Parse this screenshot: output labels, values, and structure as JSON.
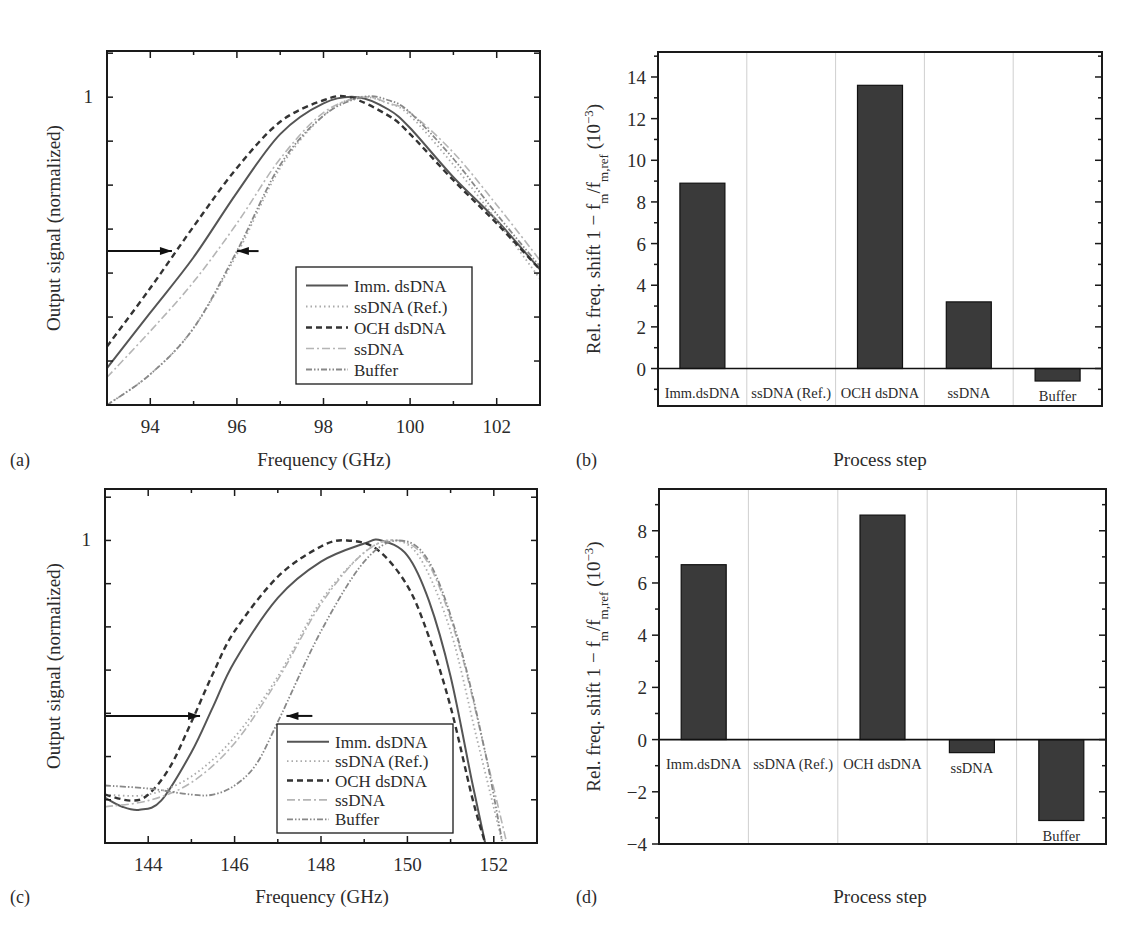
{
  "figure": {
    "panels": [
      "(a)",
      "(b)",
      "(c)",
      "(d)"
    ]
  },
  "chart_data": [
    {
      "id": "a",
      "panel_label": "(a)",
      "type": "line",
      "title": "",
      "xlabel": "Frequency (GHz)",
      "ylabel": "Output signal (normalized)",
      "xlim": [
        93,
        103
      ],
      "ylim": [
        0.0,
        1.15
      ],
      "xticks": [
        94,
        96,
        98,
        100,
        102
      ],
      "yticks_labeled": [
        {
          "value": 1,
          "label": "1"
        }
      ],
      "grid": false,
      "legend_position": "lower right",
      "annotations": [
        {
          "type": "arrow-right",
          "y": 0.5,
          "x_from": 93,
          "x_to": 94.5
        },
        {
          "type": "arrow-left",
          "y": 0.5,
          "x_from": 96.5,
          "x_to": 96.0
        }
      ],
      "series": [
        {
          "name": "Imm. dsDNA",
          "style": "solid",
          "color": "#555555",
          "x": [
            93,
            94,
            95,
            96,
            97,
            98,
            98.8,
            99.5,
            100,
            101,
            102,
            103
          ],
          "y": [
            0.12,
            0.3,
            0.48,
            0.69,
            0.88,
            0.98,
            1.0,
            0.96,
            0.9,
            0.74,
            0.6,
            0.44
          ]
        },
        {
          "name": "ssDNA (Ref.)",
          "style": "dotted",
          "color": "#aaaaaa",
          "x": [
            93,
            94,
            95,
            96,
            97,
            98,
            98.8,
            99.5,
            100,
            101,
            102,
            103
          ],
          "y": [
            0.0,
            0.1,
            0.25,
            0.49,
            0.77,
            0.94,
            1.0,
            0.98,
            0.94,
            0.78,
            0.6,
            0.41
          ]
        },
        {
          "name": "OCH dsDNA",
          "style": "dashed",
          "color": "#333333",
          "x": [
            93,
            94,
            95,
            96,
            97,
            98,
            98.6,
            99.5,
            100,
            101,
            102,
            103
          ],
          "y": [
            0.19,
            0.38,
            0.58,
            0.77,
            0.92,
            0.99,
            1.0,
            0.94,
            0.88,
            0.73,
            0.59,
            0.44
          ]
        },
        {
          "name": "ssDNA",
          "style": "dashdot",
          "color": "#b5b5b5",
          "x": [
            93,
            94,
            95,
            96,
            97,
            98,
            98.9,
            99.5,
            100,
            101,
            102,
            103
          ],
          "y": [
            0.09,
            0.24,
            0.4,
            0.59,
            0.8,
            0.95,
            1.0,
            0.98,
            0.95,
            0.82,
            0.65,
            0.47
          ]
        },
        {
          "name": "Buffer",
          "style": "dashdotdot",
          "color": "#888888",
          "x": [
            93,
            94,
            95,
            96,
            97,
            98,
            98.9,
            99.5,
            100,
            101,
            102,
            103
          ],
          "y": [
            0.0,
            0.1,
            0.25,
            0.5,
            0.78,
            0.94,
            1.0,
            0.99,
            0.95,
            0.8,
            0.62,
            0.45
          ]
        }
      ]
    },
    {
      "id": "b",
      "panel_label": "(b)",
      "type": "bar",
      "title": "",
      "xlabel": "Process step",
      "ylabel": "Rel. freq. shift 1 − f_m/f_m,ref (10^−3)",
      "ylabel_parts": {
        "main": "Rel. freq. shift 1 − f",
        "sub1": "m",
        "mid": "/f",
        "sub2": "m,ref",
        "tail": " (10",
        "sup": "−3",
        "end": ")"
      },
      "ylim": [
        -1.8,
        15.2
      ],
      "yticks": [
        0,
        2,
        4,
        6,
        8,
        10,
        12,
        14
      ],
      "grid": false,
      "categories": [
        "Imm.dsDNA",
        "ssDNA (Ref.)",
        "OCH dsDNA",
        "ssDNA",
        "Buffer"
      ],
      "values": [
        8.9,
        0.0,
        13.6,
        3.2,
        -0.6
      ],
      "bar_color": "#3a3a3a"
    },
    {
      "id": "c",
      "panel_label": "(c)",
      "type": "line",
      "title": "",
      "xlabel": "Frequency (GHz)",
      "ylabel": "Output signal (normalized)",
      "xlim": [
        143,
        153
      ],
      "ylim": [
        0.0,
        1.17
      ],
      "xticks": [
        144,
        146,
        148,
        150,
        152
      ],
      "yticks_labeled": [
        {
          "value": 1,
          "label": "1"
        }
      ],
      "grid": false,
      "legend_position": "lower right",
      "annotations": [
        {
          "type": "arrow-right",
          "y": 0.42,
          "x_from": 143,
          "x_to": 145.2
        },
        {
          "type": "arrow-left",
          "y": 0.42,
          "x_from": 147.8,
          "x_to": 147.2
        }
      ],
      "series": [
        {
          "name": "Imm. dsDNA",
          "style": "solid",
          "color": "#555555",
          "x": [
            143,
            143.4,
            143.8,
            144.3,
            145,
            145.5,
            146,
            147,
            148,
            149,
            149.4,
            150,
            150.5,
            151,
            151.5,
            151.8
          ],
          "y": [
            0.15,
            0.12,
            0.11,
            0.14,
            0.3,
            0.45,
            0.6,
            0.81,
            0.93,
            0.99,
            1.0,
            0.95,
            0.8,
            0.55,
            0.2,
            0.0
          ]
        },
        {
          "name": "ssDNA (Ref.)",
          "style": "dotted",
          "color": "#aaaaaa",
          "x": [
            143,
            144,
            145,
            146,
            147,
            148,
            149,
            149.7,
            150.3,
            151,
            151.6,
            152.2
          ],
          "y": [
            0.16,
            0.16,
            0.22,
            0.35,
            0.55,
            0.8,
            0.96,
            1.0,
            0.94,
            0.7,
            0.35,
            0.0
          ]
        },
        {
          "name": "OCH dsDNA",
          "style": "dashed",
          "color": "#333333",
          "x": [
            143,
            143.6,
            144,
            144.5,
            145,
            145.5,
            146,
            147,
            148,
            148.6,
            149.3,
            150,
            150.5,
            151,
            151.5,
            151.8
          ],
          "y": [
            0.16,
            0.14,
            0.16,
            0.25,
            0.4,
            0.56,
            0.7,
            0.88,
            0.98,
            1.0,
            0.97,
            0.85,
            0.68,
            0.45,
            0.15,
            0.0
          ]
        },
        {
          "name": "ssDNA",
          "style": "dashdot",
          "color": "#b5b5b5",
          "x": [
            143,
            144,
            145,
            146,
            147,
            148,
            149,
            149.8,
            150.5,
            151.2,
            151.8,
            152.3
          ],
          "y": [
            0.12,
            0.14,
            0.2,
            0.33,
            0.54,
            0.79,
            0.96,
            1.0,
            0.92,
            0.65,
            0.3,
            0.0
          ]
        },
        {
          "name": "Buffer",
          "style": "dashdotdot",
          "color": "#888888",
          "x": [
            143,
            144,
            145,
            145.5,
            146,
            146.5,
            147,
            148,
            149,
            149.8,
            150.5,
            151.2,
            151.8,
            152.2
          ],
          "y": [
            0.19,
            0.18,
            0.16,
            0.16,
            0.19,
            0.26,
            0.4,
            0.7,
            0.93,
            1.0,
            0.93,
            0.66,
            0.3,
            0.0
          ]
        }
      ]
    },
    {
      "id": "d",
      "panel_label": "(d)",
      "type": "bar",
      "title": "",
      "xlabel": "Process step",
      "ylabel": "Rel. freq. shift 1 − f_m/f_m,ref (10^−3)",
      "ylabel_parts": {
        "main": "Rel. freq. shift 1 − f",
        "sub1": "m",
        "mid": "/f",
        "sub2": "m,ref",
        "tail": " (10",
        "sup": "−3",
        "end": ")"
      },
      "ylim": [
        -4,
        9.6
      ],
      "yticks": [
        -4,
        -2,
        0,
        2,
        4,
        6,
        8
      ],
      "grid": false,
      "categories": [
        "Imm.dsDNA",
        "ssDNA (Ref.)",
        "OCH dsDNA",
        "ssDNA",
        "Buffer"
      ],
      "values": [
        6.7,
        0.0,
        8.6,
        -0.5,
        -3.1
      ],
      "bar_color": "#3a3a3a"
    }
  ]
}
